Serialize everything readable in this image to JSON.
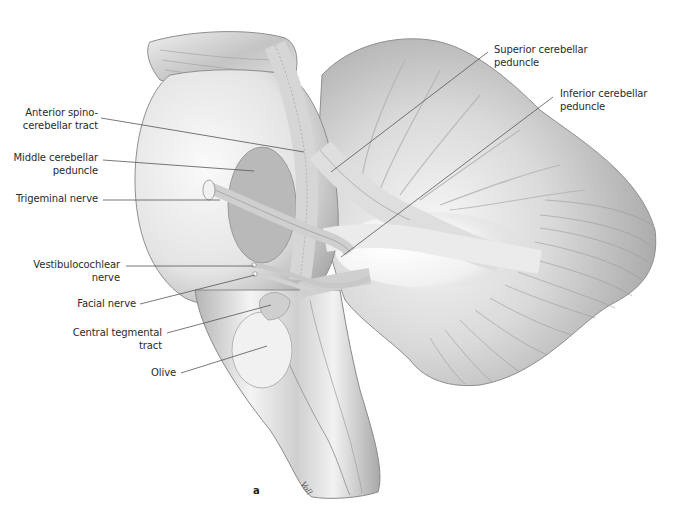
{
  "figure": {
    "panel_letter": "a",
    "signature": "Voll",
    "colors": {
      "background": "#ffffff",
      "label_text": "#2b2b2b",
      "leader_line": "#555555",
      "tissue_light": "#f2f2f2",
      "tissue_mid": "#c8c8c8",
      "tissue_dark": "#8c8c8c"
    },
    "labels": [
      {
        "id": "anterior-spinocerebellar-tract",
        "lines": "Anterior spino-\ncerebellar tract",
        "align": "right",
        "x": 2,
        "y": 107,
        "w": 96,
        "line_from": [
          101,
          118
        ],
        "line_to": [
          304,
          152
        ]
      },
      {
        "id": "middle-cerebellar-peduncle",
        "lines": "Middle cerebellar\npeduncle",
        "align": "right",
        "x": 2,
        "y": 152,
        "w": 96,
        "line_from": [
          103,
          160
        ],
        "line_to": [
          254,
          171
        ]
      },
      {
        "id": "trigeminal-nerve",
        "lines": "Trigeminal nerve",
        "align": "right",
        "x": 2,
        "y": 193,
        "w": 96,
        "line_from": [
          103,
          200
        ],
        "line_to": [
          220,
          200
        ]
      },
      {
        "id": "vestibulocochlear-nerve",
        "lines": "Vestibulocochlear\nnerve",
        "align": "right",
        "x": 2,
        "y": 259,
        "w": 118,
        "line_from": [
          126,
          266
        ],
        "line_to": [
          254,
          266
        ]
      },
      {
        "id": "facial-nerve",
        "lines": "Facial nerve",
        "align": "right",
        "x": 2,
        "y": 298,
        "w": 134,
        "line_from": [
          140,
          304
        ],
        "line_to": [
          255,
          275
        ]
      },
      {
        "id": "central-tegmental-tract",
        "lines": "Central tegmental\ntract",
        "align": "right",
        "x": 2,
        "y": 327,
        "w": 160,
        "line_from": [
          167,
          333
        ],
        "line_to": [
          271,
          305
        ]
      },
      {
        "id": "olive",
        "lines": "Olive",
        "align": "right",
        "x": 2,
        "y": 367,
        "w": 174,
        "line_from": [
          181,
          373
        ],
        "line_to": [
          267,
          346
        ]
      },
      {
        "id": "superior-cerebellar-peduncle",
        "lines": "Superior cerebellar\npeduncle",
        "align": "left",
        "x": 494,
        "y": 44,
        "w": 130,
        "line_from": [
          488,
          52
        ],
        "line_to": [
          331,
          172
        ]
      },
      {
        "id": "inferior-cerebellar-peduncle",
        "lines": "Inferior cerebellar\npeduncle",
        "align": "left",
        "x": 560,
        "y": 88,
        "w": 130,
        "line_from": [
          553,
          97
        ],
        "line_to": [
          341,
          257
        ]
      }
    ]
  }
}
